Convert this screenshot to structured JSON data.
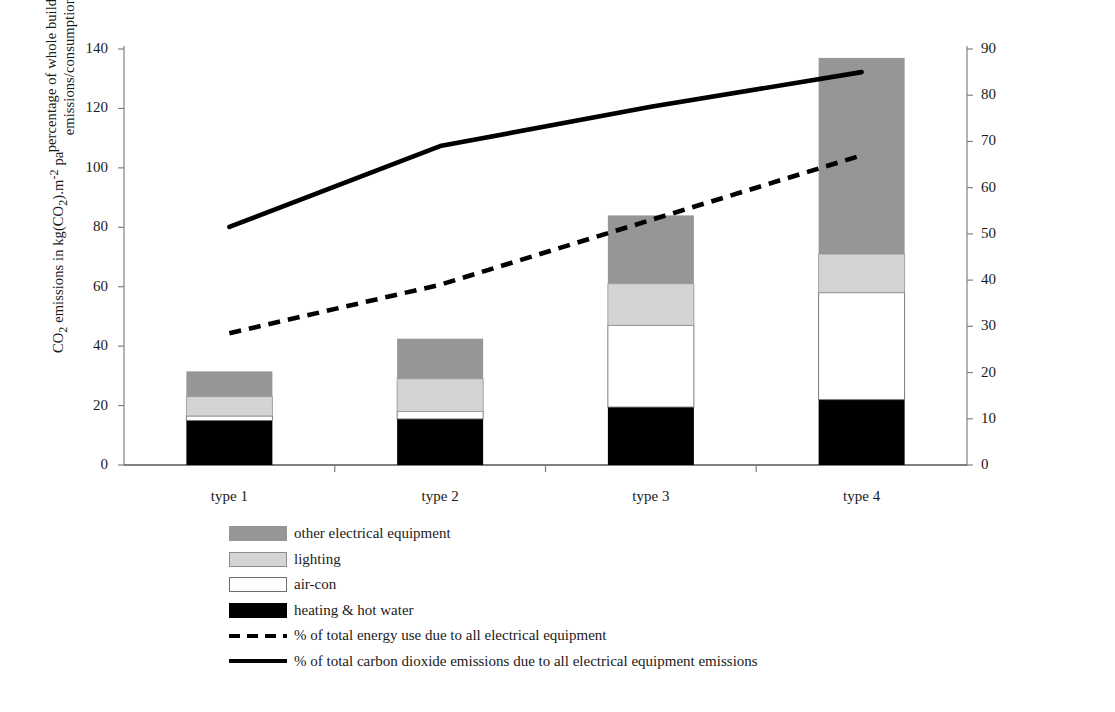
{
  "chart_data": {
    "type": "bar",
    "title": "",
    "subtitle": "",
    "categories": [
      "type 1",
      "type 2",
      "type 3",
      "type 4"
    ],
    "xlabel": "",
    "ylabel": "CO2 emissions in kg(CO2).m-2 pa",
    "y2label": "percentage of whole building emissions/consumption",
    "ylim": [
      0,
      140
    ],
    "y2lim": [
      0,
      90
    ],
    "yticks": [
      0,
      20,
      40,
      60,
      80,
      100,
      120,
      140
    ],
    "y2ticks": [
      0,
      10,
      20,
      30,
      40,
      50,
      60,
      70,
      80,
      90
    ],
    "grid": false,
    "stacked": true,
    "legend_position": "below-left",
    "series": [
      {
        "name": "heating & hot water",
        "type": "bar",
        "axis": "left",
        "color": "#000000",
        "values": [
          15.0,
          15.5,
          19.5,
          22.0
        ]
      },
      {
        "name": "air-con",
        "type": "bar",
        "axis": "left",
        "color": "#ffffff",
        "values": [
          1.5,
          2.5,
          27.5,
          36.0
        ]
      },
      {
        "name": "lighting",
        "type": "bar",
        "axis": "left",
        "color": "#d4d4d4",
        "values": [
          6.5,
          11.0,
          14.0,
          13.0
        ]
      },
      {
        "name": "other electrical equipment",
        "type": "bar",
        "axis": "left",
        "color": "#969696",
        "values": [
          8.5,
          13.5,
          23.0,
          66.0
        ]
      },
      {
        "name": "% of total energy use due to all electrical equipment",
        "type": "line",
        "style": "dashed",
        "axis": "right",
        "color": "#000000",
        "values": [
          28.5,
          39.0,
          53.0,
          67.0
        ]
      },
      {
        "name": "% of total carbon dioxide emissions due to all electrical equipment emissions",
        "type": "line",
        "style": "solid",
        "axis": "right",
        "color": "#000000",
        "values": [
          51.5,
          69.0,
          77.5,
          85.0
        ]
      }
    ],
    "bar_totals": [
      31.5,
      42.5,
      84.0,
      137.0
    ]
  },
  "axes": {
    "left_title_parts": {
      "pre": "CO",
      "sub1": "2",
      "mid": " emissions in kg(CO",
      "sub2": "2",
      "post": ").m",
      "sup": "-2",
      "tail": " pa"
    },
    "right_title_line1": "percentage of whole building",
    "right_title_line2": "emissions/consumption",
    "left_ticks": [
      "140",
      "120",
      "100",
      "80",
      "60",
      "40",
      "20",
      "0"
    ],
    "right_ticks": [
      "90",
      "80",
      "70",
      "60",
      "50",
      "40",
      "30",
      "20",
      "10",
      "0"
    ],
    "categories": [
      "type 1",
      "type 2",
      "type 3",
      "type 4"
    ]
  },
  "legend": {
    "items": [
      {
        "key": "other",
        "label": "other electrical equipment"
      },
      {
        "key": "lighting",
        "label": "lighting"
      },
      {
        "key": "aircon",
        "label": "air-con"
      },
      {
        "key": "heat",
        "label": "heating & hot water"
      },
      {
        "key": "dashed",
        "label": "% of total energy use due to all electrical equipment"
      },
      {
        "key": "solid",
        "label": "% of total carbon dioxide emissions due to all electrical equipment emissions"
      }
    ]
  },
  "colors": {
    "other_electrical": "#969696",
    "lighting": "#d4d4d4",
    "air_con": "#ffffff",
    "heating": "#000000",
    "lines": "#000000",
    "axis": "#808080"
  }
}
